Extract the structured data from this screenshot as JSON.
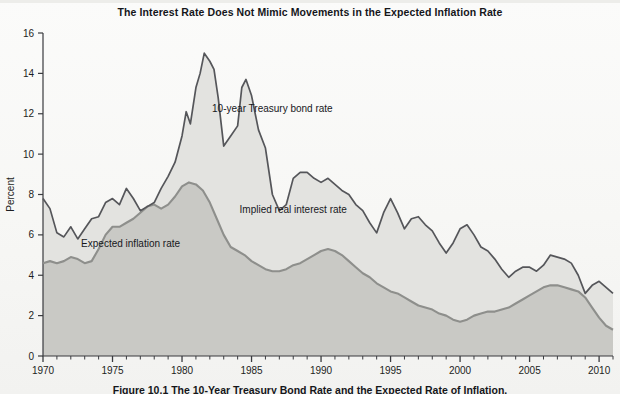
{
  "chart_title": "The Interest Rate Does Not Mimic Movements in the Expected Inflation Rate",
  "figure_caption": "Figure 10.1  The 10-Year Treasury Bond Rate and the Expected Rate of Inflation.",
  "labels": {
    "bond": "10-year Treasury bond rate",
    "implied_real": "Implied real interest rate",
    "expected_inflation": "Expected inflation rate"
  },
  "colors": {
    "bond_line": "#55565a",
    "inflation_line": "#8e8f8c",
    "upper_fill": "#e3e3e0",
    "lower_fill": "#c9c9c5",
    "axis": "#3a3b3f",
    "text": "#15161a",
    "page_background": "#f7f7f5"
  },
  "chart_data": {
    "type": "area",
    "title": "The Interest Rate Does Not Mimic Movements in the Expected Inflation Rate",
    "xlabel": "",
    "ylabel": "Percent",
    "xlim": [
      1970,
      2011
    ],
    "ylim": [
      0,
      16
    ],
    "ytick_step": 2,
    "grid": false,
    "legend": "in-plot annotations",
    "yticks": [
      0,
      2,
      4,
      6,
      8,
      10,
      12,
      14,
      16
    ],
    "ytick_labels": [
      "0",
      "2",
      "4",
      "6",
      "8",
      "10",
      "12",
      "14",
      "16"
    ],
    "xticks": [
      1970,
      1975,
      1980,
      1985,
      1990,
      1995,
      2000,
      2005,
      2010
    ],
    "xtick_labels": [
      "1970",
      "1975",
      "1980",
      "1985",
      "1990",
      "1995",
      "2000",
      "2005",
      "2010"
    ],
    "minor_xtick_interval": 1,
    "annotations": [
      {
        "text": "10-year Treasury bond rate",
        "x": 1986.5,
        "y": 12.1
      },
      {
        "text": "Implied real interest rate",
        "x": 1988.0,
        "y": 7.1
      },
      {
        "text": "Expected inflation rate",
        "x": 1976.3,
        "y": 5.4
      }
    ],
    "series": [
      {
        "name": "10-year Treasury bond rate",
        "x": [
          1970.0,
          1970.5,
          1971.0,
          1971.5,
          1972.0,
          1972.5,
          1973.0,
          1973.5,
          1974.0,
          1974.5,
          1975.0,
          1975.5,
          1976.0,
          1976.5,
          1977.0,
          1977.5,
          1978.0,
          1978.5,
          1979.0,
          1979.5,
          1980.0,
          1980.3,
          1980.6,
          1981.0,
          1981.3,
          1981.6,
          1982.0,
          1982.3,
          1982.6,
          1983.0,
          1983.5,
          1984.0,
          1984.3,
          1984.6,
          1985.0,
          1985.5,
          1986.0,
          1986.5,
          1987.0,
          1987.5,
          1988.0,
          1988.5,
          1989.0,
          1989.5,
          1990.0,
          1990.5,
          1991.0,
          1991.5,
          1992.0,
          1992.5,
          1993.0,
          1993.5,
          1994.0,
          1994.5,
          1995.0,
          1995.5,
          1996.0,
          1996.5,
          1997.0,
          1997.5,
          1998.0,
          1998.5,
          1999.0,
          1999.5,
          2000.0,
          2000.5,
          2001.0,
          2001.5,
          2002.0,
          2002.5,
          2003.0,
          2003.5,
          2004.0,
          2004.5,
          2005.0,
          2005.5,
          2006.0,
          2006.5,
          2007.0,
          2007.5,
          2008.0,
          2008.5,
          2009.0,
          2009.5,
          2010.0,
          2010.5,
          2011.0
        ],
        "y": [
          7.8,
          7.3,
          6.1,
          5.9,
          6.4,
          5.8,
          6.3,
          6.8,
          6.9,
          7.6,
          7.8,
          7.5,
          8.3,
          7.8,
          7.2,
          7.4,
          7.6,
          8.3,
          8.9,
          9.6,
          10.9,
          12.1,
          11.5,
          13.3,
          14.0,
          15.0,
          14.6,
          14.2,
          12.8,
          10.4,
          10.9,
          11.4,
          13.3,
          13.7,
          12.9,
          11.2,
          10.3,
          8.0,
          7.2,
          7.5,
          8.8,
          9.1,
          9.1,
          8.8,
          8.6,
          8.8,
          8.5,
          8.2,
          8.0,
          7.5,
          7.2,
          6.6,
          6.1,
          7.1,
          7.8,
          7.1,
          6.3,
          6.8,
          6.9,
          6.5,
          6.2,
          5.6,
          5.1,
          5.6,
          6.3,
          6.5,
          6.0,
          5.4,
          5.2,
          4.8,
          4.3,
          3.9,
          4.2,
          4.4,
          4.4,
          4.2,
          4.5,
          5.0,
          4.9,
          4.8,
          4.6,
          4.0,
          3.1,
          3.5,
          3.7,
          3.4,
          3.1
        ],
        "style": "line",
        "color": "#55565a"
      },
      {
        "name": "Expected inflation rate",
        "x": [
          1970.0,
          1970.5,
          1971.0,
          1971.5,
          1972.0,
          1972.5,
          1973.0,
          1973.5,
          1974.0,
          1974.5,
          1975.0,
          1975.5,
          1976.0,
          1976.5,
          1977.0,
          1977.5,
          1978.0,
          1978.5,
          1979.0,
          1979.5,
          1980.0,
          1980.5,
          1981.0,
          1981.5,
          1982.0,
          1982.5,
          1983.0,
          1983.5,
          1984.0,
          1984.5,
          1985.0,
          1985.5,
          1986.0,
          1986.5,
          1987.0,
          1987.5,
          1988.0,
          1988.5,
          1989.0,
          1989.5,
          1990.0,
          1990.5,
          1991.0,
          1991.5,
          1992.0,
          1992.5,
          1993.0,
          1993.5,
          1994.0,
          1994.5,
          1995.0,
          1995.5,
          1996.0,
          1996.5,
          1997.0,
          1997.5,
          1998.0,
          1998.5,
          1999.0,
          1999.5,
          2000.0,
          2000.5,
          2001.0,
          2001.5,
          2002.0,
          2002.5,
          2003.0,
          2003.5,
          2004.0,
          2004.5,
          2005.0,
          2005.5,
          2006.0,
          2006.5,
          2007.0,
          2007.5,
          2008.0,
          2008.5,
          2009.0,
          2009.5,
          2010.0,
          2010.5,
          2011.0
        ],
        "y": [
          4.6,
          4.7,
          4.6,
          4.7,
          4.9,
          4.8,
          4.6,
          4.7,
          5.3,
          6.0,
          6.4,
          6.4,
          6.6,
          6.8,
          7.1,
          7.4,
          7.5,
          7.3,
          7.5,
          7.9,
          8.4,
          8.6,
          8.5,
          8.2,
          7.6,
          6.8,
          6.0,
          5.4,
          5.2,
          5.0,
          4.7,
          4.5,
          4.3,
          4.2,
          4.2,
          4.3,
          4.5,
          4.6,
          4.8,
          5.0,
          5.2,
          5.3,
          5.2,
          5.0,
          4.7,
          4.4,
          4.1,
          3.9,
          3.6,
          3.4,
          3.2,
          3.1,
          2.9,
          2.7,
          2.5,
          2.4,
          2.3,
          2.1,
          2.0,
          1.8,
          1.7,
          1.8,
          2.0,
          2.1,
          2.2,
          2.2,
          2.3,
          2.4,
          2.6,
          2.8,
          3.0,
          3.2,
          3.4,
          3.5,
          3.5,
          3.4,
          3.3,
          3.2,
          2.9,
          2.4,
          1.9,
          1.5,
          1.3
        ],
        "style": "line+fill",
        "color": "#8e8f8c"
      }
    ],
    "derived_series": [
      {
        "name": "Implied real interest rate",
        "description": "Vertical gap between the 10-year Treasury bond rate line and the expected inflation rate line; shown as the lighter shaded band."
      }
    ]
  }
}
